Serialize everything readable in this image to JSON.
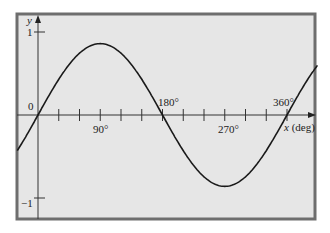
{
  "chart_data": {
    "type": "line",
    "title": "",
    "xlabel": "x (deg)",
    "ylabel": "y",
    "x_ticks": [
      0,
      30,
      60,
      90,
      120,
      150,
      180,
      210,
      240,
      270,
      300,
      330,
      360
    ],
    "x_tick_labels": [
      "90°",
      "180°",
      "270°",
      "360°"
    ],
    "x_tick_label_values": [
      90,
      180,
      270,
      360
    ],
    "y_tick_labels": [
      "1",
      "0",
      "−1"
    ],
    "y_tick_values": [
      1,
      0,
      -1
    ],
    "xlim": [
      -30,
      405
    ],
    "ylim": [
      -1.2,
      1.2
    ],
    "grid": false,
    "series": [
      {
        "name": "y = sin x",
        "x": [
          -30,
          0,
          30,
          60,
          90,
          120,
          150,
          180,
          210,
          240,
          270,
          300,
          330,
          360,
          390,
          405
        ],
        "y": [
          -0.43,
          0,
          0.43,
          0.74,
          0.86,
          0.74,
          0.43,
          0,
          -0.43,
          -0.74,
          -0.86,
          -0.74,
          -0.43,
          0,
          0.43,
          0.6
        ]
      }
    ],
    "colors": {
      "background": "#e6e6e6",
      "frame": "#6e6e6e",
      "curve": "#1a1a1a",
      "axis": "#333333"
    }
  },
  "labels": {
    "y_axis": "y",
    "x_axis": "x (deg)",
    "y_one": "1",
    "y_zero": "0",
    "y_minus_one": "−1",
    "x90": "90°",
    "x180": "180°",
    "x270": "270°",
    "x360": "360°"
  }
}
